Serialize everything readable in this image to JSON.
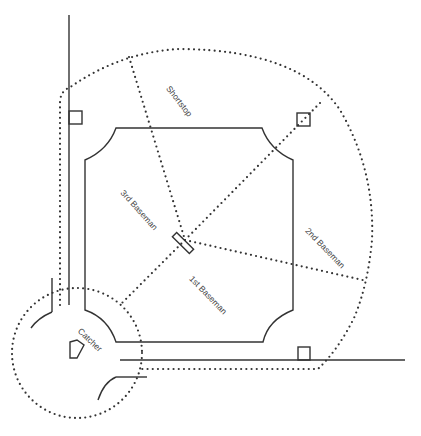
{
  "diagram": {
    "title": "",
    "type": "baseball field defensive positions",
    "labels": {
      "shortstop": "Shortstop",
      "third_baseman": "3rd Baseman",
      "first_baseman": "1st Baseman",
      "second_baseman": "2nd Baseman",
      "catcher": "Catcher"
    },
    "elements": [
      "third-base-foul-line",
      "first-base-foul-line",
      "infield-boundary",
      "outfield-coverage-arc",
      "catcher-coverage-circle",
      "pitchers-rubber",
      "home-plate",
      "first-base",
      "second-base",
      "third-base"
    ],
    "colors": {
      "line": "#333333",
      "text": "#444444",
      "background": "#ffffff"
    }
  }
}
